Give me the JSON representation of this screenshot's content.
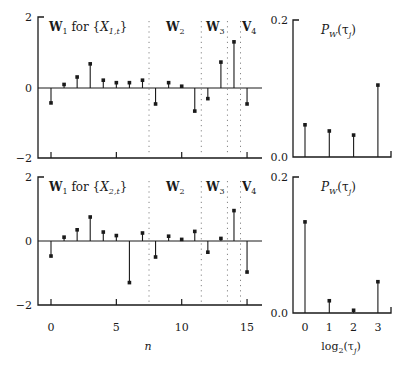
{
  "chart_data": [
    {
      "type": "stem",
      "panel": "top-left",
      "title": "W1 for {X1,t}",
      "section_labels": [
        "W1 for {X1,t}",
        "W2",
        "W3",
        "V4"
      ],
      "section_boundaries_n": [
        7.5,
        11.5,
        13.5,
        14.5
      ],
      "xlabel": "n",
      "ylabel": "",
      "x": [
        0,
        1,
        2,
        3,
        4,
        5,
        6,
        7,
        8,
        9,
        10,
        11,
        12,
        13,
        14,
        15
      ],
      "values": [
        -0.42,
        0.1,
        0.31,
        0.68,
        0.22,
        0.15,
        0.15,
        0.22,
        -0.45,
        0.15,
        0.05,
        -0.65,
        -0.3,
        0.73,
        1.3,
        -0.45
      ],
      "ylim": [
        -2,
        2
      ],
      "yticks": [
        -2,
        0,
        2
      ],
      "xticks": [
        0,
        5,
        10,
        15
      ]
    },
    {
      "type": "stem",
      "panel": "top-right",
      "title": "P_W(τ_j)",
      "xlabel": "log2(τ_j)",
      "x": [
        0,
        1,
        2,
        3
      ],
      "values": [
        0.047,
        0.038,
        0.032,
        0.105
      ],
      "ylim": [
        0.0,
        0.2
      ],
      "yticks": [
        0.0,
        0.2
      ]
    },
    {
      "type": "stem",
      "panel": "bottom-left",
      "title": "W1 for {X2,t}",
      "section_labels": [
        "W1 for {X2,t}",
        "W2",
        "W3",
        "V4"
      ],
      "section_boundaries_n": [
        7.5,
        11.5,
        13.5,
        14.5
      ],
      "xlabel": "n",
      "x": [
        0,
        1,
        2,
        3,
        4,
        5,
        6,
        7,
        8,
        9,
        10,
        11,
        12,
        13,
        14,
        15
      ],
      "values": [
        -0.47,
        0.12,
        0.35,
        0.75,
        0.28,
        0.17,
        -1.3,
        0.25,
        -0.5,
        0.15,
        0.05,
        0.3,
        -0.35,
        0.08,
        0.95,
        -0.97
      ],
      "ylim": [
        -2,
        2
      ],
      "yticks": [
        -2,
        0,
        2
      ],
      "xticks": [
        0,
        5,
        10,
        15
      ]
    },
    {
      "type": "stem",
      "panel": "bottom-right",
      "title": "P_W(τ_j)",
      "xlabel": "log2(τ_j)",
      "x": [
        0,
        1,
        2,
        3
      ],
      "values": [
        0.134,
        0.018,
        0.004,
        0.046
      ],
      "ylim": [
        0.0,
        0.2
      ],
      "yticks": [
        0.0,
        0.2
      ],
      "xticks": [
        0,
        1,
        2,
        3
      ]
    }
  ],
  "labels": {
    "left_xlabel": "n",
    "right_xlabel_base": "log",
    "right_xlabel_sub": "2",
    "right_xlabel_arg": "(τ",
    "right_xlabel_argsub": "j",
    "right_xlabel_close": ")",
    "y_left_top": "2",
    "y_left_zero": "0",
    "y_left_bottom": "−2",
    "y_right_top": "0.2",
    "y_right_bottom": "0.0",
    "x_left_ticks": [
      "0",
      "5",
      "10",
      "15"
    ],
    "x_right_ticks": [
      "0",
      "1",
      "2",
      "3"
    ],
    "top_w1_bold": "W",
    "top_w1_sub": "1",
    "top_w1_for": " for {X",
    "top_w1_xsub": "1,t",
    "bottom_w1_xsub": "2,t",
    "close_brace": "}",
    "w2": "W",
    "w2_sub": "2",
    "w3": "W",
    "w3_sub": "3",
    "v4": "V",
    "v4_sub": "4",
    "pw_P": "P",
    "pw_W": "W",
    "pw_arg": "(τ",
    "pw_j": "j",
    "pw_close": ")"
  }
}
